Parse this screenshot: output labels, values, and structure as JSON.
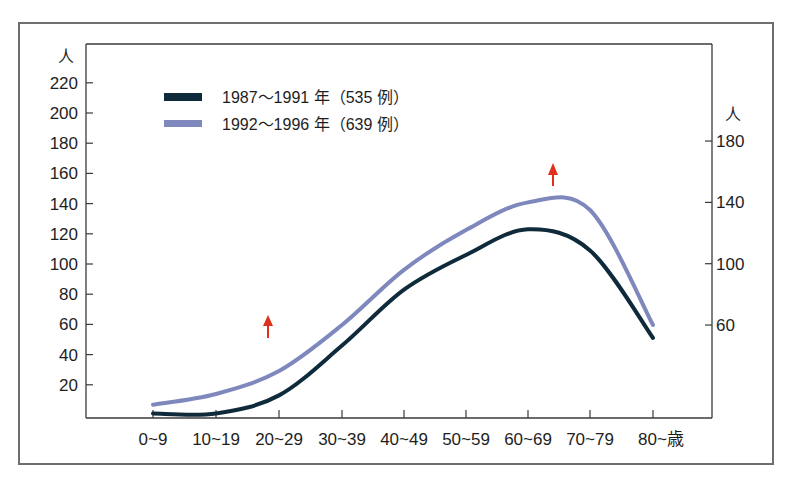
{
  "chart_data": {
    "type": "line",
    "title": "",
    "xlabel": "歳",
    "ylabel_left": "人",
    "ylabel_right": "人",
    "categories": [
      "0~9",
      "10~19",
      "20~29",
      "30~39",
      "40~49",
      "50~59",
      "60~69",
      "70~79",
      "80~"
    ],
    "x_tick_labels": [
      "0~9",
      "10~19",
      "20~29",
      "30~39",
      "40~49",
      "50~59",
      "60~69",
      "70~79",
      "80~歳"
    ],
    "left_axis": {
      "unit": "人",
      "ticks": [
        20,
        40,
        60,
        80,
        100,
        120,
        140,
        160,
        180,
        200,
        220
      ],
      "ylim": [
        0,
        220
      ]
    },
    "right_axis": {
      "unit": "人",
      "ticks": [
        60,
        100,
        140,
        180
      ],
      "ylim": [
        0,
        190
      ]
    },
    "series": [
      {
        "name": "1987〜1991 年（535 例）",
        "color": "#0f2a3a",
        "axis": "left",
        "values": [
          1,
          1,
          13,
          46,
          83,
          106,
          123,
          109,
          51
        ]
      },
      {
        "name": "1992〜1996 年（639 例）",
        "color": "#7f88bd",
        "axis": "right",
        "values": [
          8,
          15,
          30,
          60,
          96,
          122,
          140,
          135,
          60
        ]
      }
    ],
    "annotations": [
      {
        "type": "arrow-up",
        "color": "#e0301e",
        "near": "20~29",
        "description": "red up arrow"
      },
      {
        "type": "arrow-up",
        "color": "#e0301e",
        "near": "60~69",
        "description": "red up arrow"
      }
    ],
    "grid": false,
    "legend_position": "top-left inside"
  },
  "legend": {
    "items": [
      {
        "label": "1987〜1991 年（535 例）",
        "color": "#0f2a3a"
      },
      {
        "label": "1992〜1996 年（639 例）",
        "color": "#7f88bd"
      }
    ]
  },
  "axes": {
    "left_unit": "人",
    "right_unit": "人",
    "left_ticks": [
      "220",
      "200",
      "180",
      "160",
      "140",
      "120",
      "100",
      "80",
      "60",
      "40",
      "20"
    ],
    "right_ticks": [
      "180",
      "140",
      "100",
      "60"
    ],
    "x_ticks": [
      "0~9",
      "10~19",
      "20~29",
      "30~39",
      "40~49",
      "50~59",
      "60~69",
      "70~79",
      "80~歳"
    ]
  },
  "colors": {
    "frame": "#6e6e6e",
    "axis": "#3a3a3a",
    "series_1": "#0f2a3a",
    "series_2": "#7f88bd",
    "arrow": "#e0301e"
  }
}
